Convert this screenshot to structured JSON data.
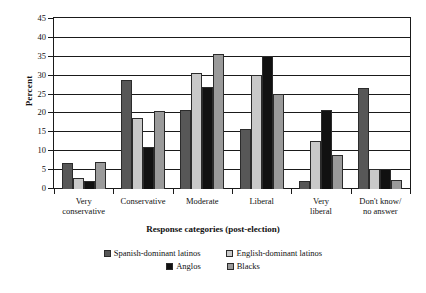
{
  "chart_data": {
    "type": "bar",
    "title": "",
    "xlabel": "Response categories (post-election)",
    "ylabel": "Percent",
    "ylim": [
      0,
      45
    ],
    "ytick_step": 5,
    "yticks": [
      0,
      5,
      10,
      15,
      20,
      25,
      30,
      35,
      40,
      45
    ],
    "grid": true,
    "legend_position": "bottom",
    "categories": [
      "Very conservative",
      "Conservative",
      "Moderate",
      "Liberal",
      "Very liberal",
      "Don't know/ no answer"
    ],
    "category_lines": [
      [
        "Very",
        "conservative"
      ],
      [
        "Conservative"
      ],
      [
        "Moderate"
      ],
      [
        "Liberal"
      ],
      [
        "Very",
        "liberal"
      ],
      [
        "Don't know/",
        "no answer"
      ]
    ],
    "series": [
      {
        "name": "Spanish-dominant latinos",
        "color": "#575757",
        "values": [
          7.0,
          28.8,
          20.9,
          16.0,
          2.2,
          26.8
        ]
      },
      {
        "name": "English-dominant latinos",
        "color": "#c9c9c9",
        "values": [
          3.0,
          18.9,
          30.7,
          30.1,
          12.6,
          5.2
        ]
      },
      {
        "name": "Anglos",
        "color": "#111111",
        "values": [
          2.0,
          11.0,
          27.1,
          35.1,
          20.8,
          5.3
        ]
      },
      {
        "name": "Blacks",
        "color": "#9a9a9a",
        "values": [
          7.2,
          20.6,
          35.8,
          25.2,
          8.9,
          2.4
        ]
      }
    ]
  },
  "legend": {
    "row1": [
      "Spanish-dominant latinos",
      "English-dominant latinos"
    ],
    "row2": [
      "Anglos",
      "Blacks"
    ]
  }
}
